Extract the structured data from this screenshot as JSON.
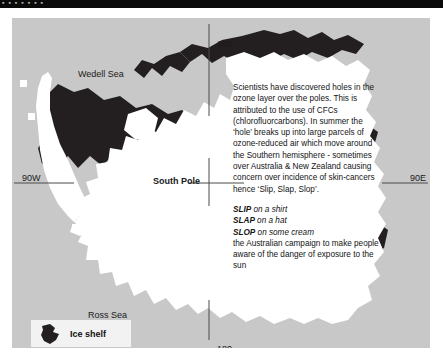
{
  "figure": {
    "type": "map",
    "colors": {
      "ocean_background": "#c8c8c8",
      "landmass": "#ffffff",
      "ice_shelf": "#231f20",
      "graticule_line": "#4a4a4a",
      "text": "#141414",
      "legend_background": "#f2f2f2",
      "top_strip": "#0a0a0a"
    }
  },
  "top_strip": {
    "text": "▪ ▪ ▪ ▪ ▪ ▪ ▪"
  },
  "map_labels": {
    "wedell_sea": "Wedell Sea",
    "ross_sea": "Ross Sea",
    "south_pole": "South Pole",
    "longitude_90w": "90W",
    "longitude_90e": "90E",
    "longitude_180_top": "180",
    "longitude_180_bottom": "180"
  },
  "info_panel": {
    "paragraph": "Scientists have discovered holes in the ozone layer over the poles. This is attributed to the use of CFCs (chlorofluorcarbons). In summer the ‘hole’ breaks up into large parcels of ozone-reduced air which move around the Southern hemisphere - sometimes over Australia & New Zealand causing concern over incidence of skin-cancers hence ‘Slip, Slap, Slop’.",
    "slogans": [
      {
        "word": "SLIP",
        "rest": " on a shirt"
      },
      {
        "word": "SLAP",
        "rest": " on a hat"
      },
      {
        "word": "SLOP",
        "rest": " on some cream"
      }
    ],
    "campaign": "the Australian campaign to make people aware of the danger of exposure to the sun"
  },
  "legend": {
    "label": "Ice shelf",
    "swatch_color": "#231f20"
  }
}
